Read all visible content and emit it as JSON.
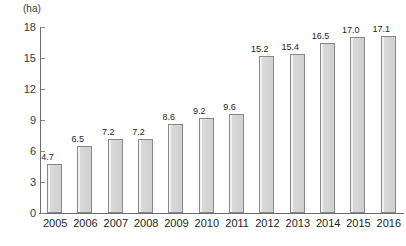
{
  "chart_data": {
    "type": "bar",
    "title": "",
    "subtitle": "",
    "xlabel": "",
    "ylabel": "",
    "unit_label": "(ha)",
    "categories": [
      "2005",
      "2006",
      "2007",
      "2008",
      "2009",
      "2010",
      "2011",
      "2012",
      "2013",
      "2014",
      "2015",
      "2016"
    ],
    "values": [
      4.7,
      6.5,
      7.2,
      7.2,
      8.6,
      9.2,
      9.6,
      15.2,
      15.4,
      16.5,
      17.0,
      17.1
    ],
    "value_labels": [
      "4.7",
      "6.5",
      "7.2",
      "7.2",
      "8.6",
      "9.2",
      "9.6",
      "15.2",
      "15.4",
      "16.5",
      "17.0",
      "17.1"
    ],
    "ylim": [
      0,
      18
    ],
    "yticks": [
      18,
      15,
      12,
      9,
      6,
      3,
      0
    ],
    "ytick_labels": [
      "18",
      "15",
      "12",
      "9",
      "6",
      "3",
      "0"
    ],
    "grid": false,
    "legend": null,
    "bar_fill_color": "#d4d4d4",
    "bar_border_color": "#888888",
    "axis_color": "#6d6d6d",
    "text_color": "#231f20"
  }
}
